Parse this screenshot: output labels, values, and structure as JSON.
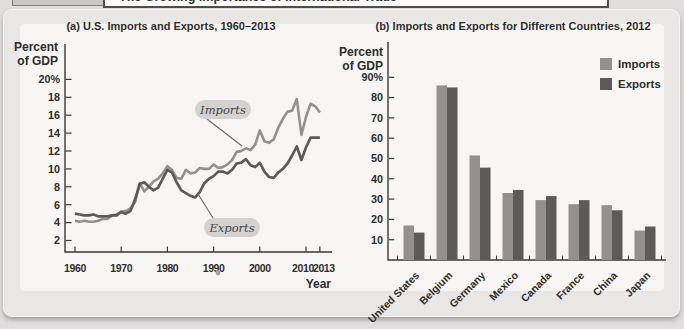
{
  "header": {
    "title": "The Growing Importance of International Trade"
  },
  "panel_a": {
    "title": "(a) U.S. Imports and Exports, 1960–2013",
    "y_label_1": "Percent",
    "y_label_2": "of GDP",
    "x_label": "Year",
    "imports_label": "Imports",
    "exports_label": "Exports"
  },
  "panel_b": {
    "title": "(b) Imports and Exports for Different Countries, 2012",
    "y_label_1": "Percent",
    "y_label_2": "of GDP"
  },
  "colors": {
    "imports": "#94918d",
    "exports": "#5d5b58",
    "axis": "#3a3a38",
    "text": "#2d2d2c",
    "pill_bg": "#d3d2ce",
    "leader": "#6b6a67"
  },
  "chart_data": [
    {
      "type": "line",
      "title": "(a) U.S. Imports and Exports, 1960–2013",
      "xlabel": "Year",
      "ylabel": "Percent of GDP",
      "x_tick_values": [
        1960,
        1970,
        1980,
        1990,
        2000,
        2010,
        2013
      ],
      "x_tick_labels": [
        "1960",
        "1970",
        "1980",
        "1990",
        "2000",
        "2010",
        "2013"
      ],
      "y_tick_values": [
        20,
        18,
        16,
        14,
        12,
        10,
        8,
        6,
        4,
        2
      ],
      "y_tick_labels": [
        "20%",
        "18",
        "16",
        "14",
        "12",
        "10",
        "8",
        "6",
        "4",
        "2"
      ],
      "ylim": [
        0,
        21
      ],
      "xlim": [
        1960,
        2013
      ],
      "grid": false,
      "x": [
        1960,
        1961,
        1962,
        1963,
        1964,
        1965,
        1966,
        1967,
        1968,
        1969,
        1970,
        1971,
        1972,
        1973,
        1974,
        1975,
        1976,
        1977,
        1978,
        1979,
        1980,
        1981,
        1982,
        1983,
        1984,
        1985,
        1986,
        1987,
        1988,
        1989,
        1990,
        1991,
        1992,
        1993,
        1994,
        1995,
        1996,
        1997,
        1998,
        1999,
        2000,
        2001,
        2002,
        2003,
        2004,
        2005,
        2006,
        2007,
        2008,
        2009,
        2010,
        2011,
        2012,
        2013
      ],
      "series": [
        {
          "name": "Imports",
          "values": [
            4.2,
            4.1,
            4.2,
            4.1,
            4.1,
            4.2,
            4.4,
            4.4,
            4.8,
            4.9,
            5.2,
            5.3,
            5.6,
            6.3,
            8.4,
            7.5,
            8.0,
            8.6,
            8.9,
            9.5,
            10.3,
            9.9,
            9.0,
            8.9,
            9.9,
            9.5,
            9.6,
            10.1,
            10.0,
            10.0,
            10.5,
            10.1,
            10.2,
            10.5,
            11.0,
            11.9,
            12.0,
            12.3,
            12.1,
            12.7,
            14.3,
            13.1,
            12.9,
            13.3,
            14.6,
            15.6,
            16.4,
            16.5,
            17.8,
            13.8,
            15.8,
            17.3,
            17.0,
            16.3
          ]
        },
        {
          "name": "Exports",
          "values": [
            5.0,
            4.9,
            4.8,
            4.8,
            4.9,
            4.7,
            4.7,
            4.7,
            4.8,
            4.8,
            5.2,
            5.0,
            5.3,
            6.6,
            8.3,
            8.5,
            8.0,
            7.6,
            7.9,
            8.9,
            9.9,
            9.6,
            8.5,
            7.6,
            7.3,
            7.0,
            6.8,
            7.4,
            8.4,
            8.9,
            9.2,
            9.7,
            9.7,
            9.5,
            9.9,
            10.6,
            10.7,
            11.1,
            10.4,
            10.2,
            10.7,
            9.7,
            9.1,
            9.0,
            9.6,
            10.0,
            10.6,
            11.5,
            12.5,
            11.0,
            12.4,
            13.5,
            13.5,
            13.5
          ]
        }
      ]
    },
    {
      "type": "bar",
      "title": "(b) Imports and Exports for Different Countries, 2012",
      "xlabel": "",
      "ylabel": "Percent of GDP",
      "categories": [
        "United States",
        "Belgium",
        "Germany",
        "Mexico",
        "Canada",
        "France",
        "China",
        "Japan"
      ],
      "series": [
        {
          "name": "Imports",
          "values": [
            17,
            86,
            51.5,
            33,
            29.5,
            27.5,
            27,
            14.5
          ]
        },
        {
          "name": "Exports",
          "values": [
            13.5,
            85,
            45.5,
            34.5,
            31.5,
            29.5,
            24.5,
            16.5
          ]
        }
      ],
      "y_tick_values": [
        90,
        80,
        70,
        60,
        50,
        40,
        30,
        20,
        10
      ],
      "y_tick_labels": [
        "90%",
        "80",
        "70",
        "60",
        "50",
        "40",
        "30",
        "20",
        "10"
      ],
      "ylim": [
        0,
        95
      ],
      "grid": false,
      "legend_position": "top-right"
    }
  ]
}
